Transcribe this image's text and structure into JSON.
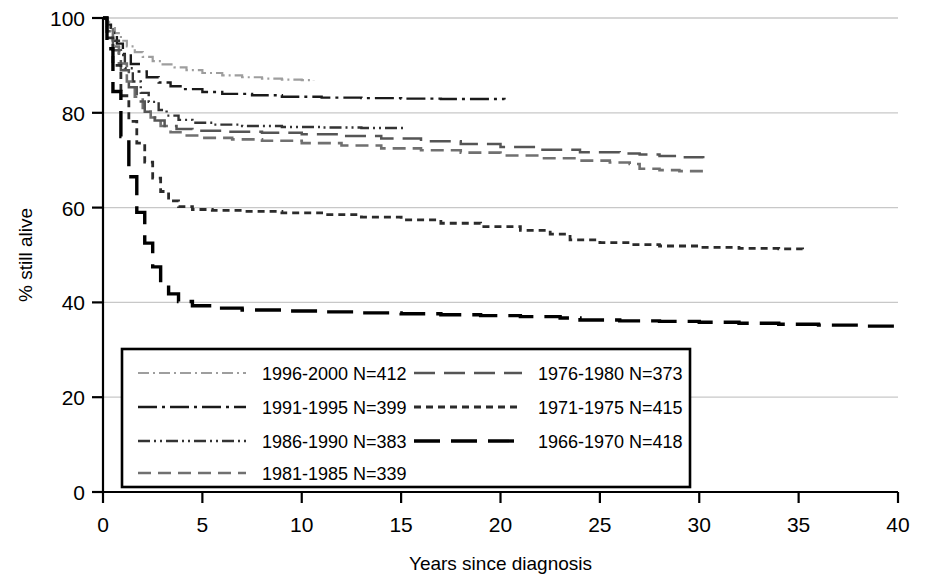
{
  "chart_data": {
    "type": "line",
    "title": "",
    "subtitle": "",
    "xlabel": "Years since diagnosis",
    "ylabel": "% still alive",
    "xlim": [
      0,
      40
    ],
    "ylim": [
      0,
      100
    ],
    "xticks": [
      0,
      5,
      10,
      15,
      20,
      25,
      30,
      35,
      40
    ],
    "yticks": [
      0,
      20,
      40,
      60,
      80,
      100
    ],
    "grid": "horizontal",
    "legend_position": "inside-bottom-left",
    "series": [
      {
        "name": "1996-2000 N=412",
        "label": "1996-2000",
        "n": 412,
        "color": "#9e9e9e",
        "dash": "dash-dot",
        "stroke_width": 2.2,
        "points": [
          [
            0,
            100
          ],
          [
            0.2,
            99.2
          ],
          [
            0.4,
            98.1
          ],
          [
            0.6,
            96.8
          ],
          [
            0.9,
            95.2
          ],
          [
            1.2,
            94.0
          ],
          [
            1.6,
            92.8
          ],
          [
            2.0,
            91.8
          ],
          [
            2.5,
            90.9
          ],
          [
            3.0,
            90.2
          ],
          [
            3.6,
            89.6
          ],
          [
            4.2,
            89.0
          ],
          [
            5.0,
            88.4
          ],
          [
            6.0,
            87.9
          ],
          [
            7.0,
            87.5
          ],
          [
            8.0,
            87.2
          ],
          [
            9.0,
            87.0
          ],
          [
            10.0,
            86.9
          ],
          [
            10.6,
            86.8
          ]
        ]
      },
      {
        "name": "1991-1995 N=399",
        "label": "1991-1995",
        "n": 399,
        "color": "#1a1a1a",
        "dash": "long-dash-dot",
        "stroke_width": 2.4,
        "points": [
          [
            0,
            100
          ],
          [
            0.2,
            98.6
          ],
          [
            0.4,
            96.9
          ],
          [
            0.7,
            94.6
          ],
          [
            1.0,
            92.4
          ],
          [
            1.4,
            90.3
          ],
          [
            1.8,
            88.7
          ],
          [
            2.2,
            87.5
          ],
          [
            2.8,
            86.4
          ],
          [
            3.4,
            85.6
          ],
          [
            4.0,
            85.0
          ],
          [
            5.0,
            84.4
          ],
          [
            6.0,
            84.0
          ],
          [
            7.5,
            83.7
          ],
          [
            9.0,
            83.4
          ],
          [
            11.0,
            83.2
          ],
          [
            13.0,
            83.1
          ],
          [
            15.0,
            83.0
          ],
          [
            17.0,
            82.9
          ],
          [
            20.2,
            82.8
          ]
        ]
      },
      {
        "name": "1986-1990 N=383",
        "label": "1986-1990",
        "n": 383,
        "color": "#333333",
        "dash": "dash-dot-dot",
        "stroke_width": 2.4,
        "points": [
          [
            0,
            100
          ],
          [
            0.2,
            98.0
          ],
          [
            0.5,
            95.2
          ],
          [
            0.8,
            92.2
          ],
          [
            1.1,
            89.4
          ],
          [
            1.5,
            86.6
          ],
          [
            1.9,
            84.2
          ],
          [
            2.3,
            82.3
          ],
          [
            2.8,
            80.6
          ],
          [
            3.2,
            79.4
          ],
          [
            3.8,
            78.5
          ],
          [
            4.5,
            77.9
          ],
          [
            5.5,
            77.5
          ],
          [
            7.0,
            77.2
          ],
          [
            9.0,
            77.0
          ],
          [
            11.0,
            76.9
          ],
          [
            13.0,
            76.8
          ],
          [
            15.2,
            76.7
          ]
        ]
      },
      {
        "name": "1981-1985 N=339",
        "label": "1981-1985",
        "n": 339,
        "color": "#707070",
        "dash": "medium-dash",
        "stroke_width": 2.6,
        "points": [
          [
            0,
            100
          ],
          [
            0.2,
            97.6
          ],
          [
            0.5,
            94.0
          ],
          [
            0.8,
            90.4
          ],
          [
            1.2,
            86.6
          ],
          [
            1.6,
            83.4
          ],
          [
            2.0,
            81.0
          ],
          [
            2.4,
            79.0
          ],
          [
            2.9,
            77.2
          ],
          [
            3.4,
            75.9
          ],
          [
            4.0,
            75.2
          ],
          [
            5.0,
            74.7
          ],
          [
            6.5,
            74.4
          ],
          [
            8.0,
            74.1
          ],
          [
            10.0,
            73.6
          ],
          [
            12.0,
            73.1
          ],
          [
            14.0,
            72.5
          ],
          [
            16.0,
            72.1
          ],
          [
            18.0,
            71.6
          ],
          [
            20.0,
            71.0
          ],
          [
            22.0,
            70.4
          ],
          [
            24.0,
            69.9
          ],
          [
            25.5,
            69.5
          ],
          [
            26.5,
            69.2
          ],
          [
            27.0,
            68.2
          ],
          [
            28.0,
            67.9
          ],
          [
            29.0,
            67.7
          ],
          [
            30.2,
            67.6
          ]
        ]
      },
      {
        "name": "1976-1980 N=373",
        "label": "1976-1980",
        "n": 373,
        "color": "#555555",
        "dash": "long-dash",
        "stroke_width": 2.5,
        "points": [
          [
            0,
            100
          ],
          [
            0.2,
            97.2
          ],
          [
            0.5,
            93.2
          ],
          [
            0.9,
            89.0
          ],
          [
            1.3,
            85.4
          ],
          [
            1.7,
            82.4
          ],
          [
            2.1,
            80.2
          ],
          [
            2.6,
            78.4
          ],
          [
            3.1,
            77.2
          ],
          [
            3.7,
            76.6
          ],
          [
            4.5,
            76.2
          ],
          [
            6.0,
            76.0
          ],
          [
            8.0,
            75.8
          ],
          [
            10.0,
            75.5
          ],
          [
            12.0,
            75.1
          ],
          [
            14.0,
            74.6
          ],
          [
            16.0,
            74.0
          ],
          [
            18.0,
            73.4
          ],
          [
            20.0,
            72.8
          ],
          [
            22.0,
            72.2
          ],
          [
            24.0,
            71.7
          ],
          [
            26.0,
            71.4
          ],
          [
            27.0,
            71.2
          ],
          [
            28.0,
            70.9
          ],
          [
            29.0,
            70.6
          ],
          [
            30.2,
            70.4
          ]
        ]
      },
      {
        "name": "1971-1975 N=415",
        "label": "1971-1975",
        "n": 415,
        "color": "#2b2b2b",
        "dash": "short-dash",
        "stroke_width": 2.8,
        "points": [
          [
            0,
            100
          ],
          [
            0.2,
            95.8
          ],
          [
            0.5,
            90.0
          ],
          [
            0.9,
            83.6
          ],
          [
            1.3,
            78.2
          ],
          [
            1.7,
            73.6
          ],
          [
            2.1,
            69.6
          ],
          [
            2.5,
            66.2
          ],
          [
            2.9,
            63.4
          ],
          [
            3.3,
            61.4
          ],
          [
            3.8,
            60.2
          ],
          [
            4.5,
            59.6
          ],
          [
            5.5,
            59.4
          ],
          [
            7.0,
            59.2
          ],
          [
            9.0,
            58.9
          ],
          [
            11.0,
            58.5
          ],
          [
            13.0,
            58.0
          ],
          [
            15.0,
            57.4
          ],
          [
            17.0,
            56.7
          ],
          [
            19.0,
            56.0
          ],
          [
            21.0,
            55.2
          ],
          [
            22.5,
            54.4
          ],
          [
            23.5,
            53.2
          ],
          [
            25.0,
            52.6
          ],
          [
            26.5,
            52.2
          ],
          [
            28.0,
            51.9
          ],
          [
            30.0,
            51.6
          ],
          [
            32.0,
            51.4
          ],
          [
            34.0,
            51.3
          ],
          [
            35.2,
            51.2
          ]
        ]
      },
      {
        "name": "1966-1970 N=418",
        "label": "1966-1970",
        "n": 418,
        "color": "#000000",
        "dash": "very-long-dash",
        "stroke_width": 3.4,
        "points": [
          [
            0,
            100
          ],
          [
            0.2,
            93.5
          ],
          [
            0.5,
            84.5
          ],
          [
            0.9,
            75.0
          ],
          [
            1.3,
            66.5
          ],
          [
            1.7,
            59.0
          ],
          [
            2.1,
            52.5
          ],
          [
            2.5,
            47.5
          ],
          [
            2.9,
            44.0
          ],
          [
            3.3,
            41.8
          ],
          [
            3.8,
            40.2
          ],
          [
            4.5,
            39.3
          ],
          [
            5.5,
            38.8
          ],
          [
            7.0,
            38.4
          ],
          [
            9.0,
            38.2
          ],
          [
            11.0,
            38.0
          ],
          [
            13.0,
            37.8
          ],
          [
            15.0,
            37.6
          ],
          [
            17.0,
            37.4
          ],
          [
            19.0,
            37.2
          ],
          [
            21.0,
            37.0
          ],
          [
            23.0,
            36.7
          ],
          [
            24.0,
            36.3
          ],
          [
            26.0,
            36.1
          ],
          [
            28.0,
            36.0
          ],
          [
            30.0,
            35.8
          ],
          [
            32.0,
            35.6
          ],
          [
            34.0,
            35.4
          ],
          [
            36.0,
            35.2
          ],
          [
            38.0,
            35.0
          ],
          [
            40.0,
            34.8
          ]
        ]
      }
    ]
  },
  "axes": {
    "y_title": "% still alive",
    "x_title": "Years since diagnosis",
    "y_ticks": [
      "0",
      "20",
      "40",
      "60",
      "80",
      "100"
    ],
    "x_ticks": [
      "0",
      "5",
      "10",
      "15",
      "20",
      "25",
      "30",
      "35",
      "40"
    ]
  },
  "legend": {
    "column_left": [
      "1996-2000 N=412",
      "1991-1995 N=399",
      "1986-1990 N=383",
      "1981-1985 N=339"
    ],
    "column_right": [
      "1976-1980 N=373",
      "1971-1975 N=415",
      "1966-1970 N=418"
    ]
  },
  "colors": {
    "axis": "#000000",
    "grid": "#c8c8c8",
    "background": "#ffffff"
  }
}
